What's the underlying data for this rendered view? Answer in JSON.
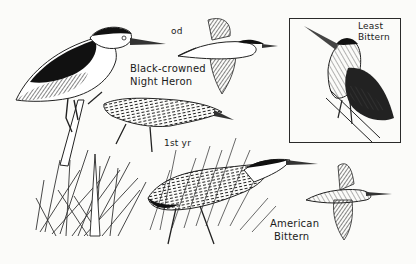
{
  "plate": {
    "background": "#fbfbf9",
    "ink": "#1a1a1a"
  },
  "labels": {
    "od": "od",
    "night_heron_line1": "Black-crowned",
    "night_heron_line2": "Night Heron",
    "first_year": "1st yr",
    "least_bittern_line1": "Least",
    "least_bittern_line2": "Bittern",
    "american_bittern_line1": "American",
    "american_bittern_line2": "Bittern"
  },
  "figures": [
    {
      "name": "Black-crowned Night Heron",
      "pose": "perched adult"
    },
    {
      "name": "Black-crowned Night Heron",
      "pose": "flying adult"
    },
    {
      "name": "Black-crowned Night Heron",
      "pose": "1st yr walking"
    },
    {
      "name": "Least Bittern",
      "pose": "perched, boxed inset"
    },
    {
      "name": "American Bittern",
      "pose": "walking in reeds"
    },
    {
      "name": "American Bittern",
      "pose": "flying"
    },
    {
      "name": "Reeds",
      "pose": "grass clump with bittern hiding"
    }
  ]
}
